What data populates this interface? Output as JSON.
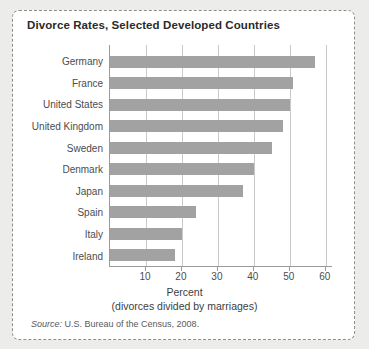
{
  "figure": {
    "title": "Divorce Rates, Selected Developed Countries",
    "source_label": "Source:",
    "source_text": "U.S. Bureau of the Census, 2008.",
    "bar_color": "#a2a2a2",
    "grid_color": "#c9c9c9",
    "axis_color": "#9a9a9a",
    "frame_color": "#8c8c8c",
    "page_background": "#ececeb",
    "card_background": "#ffffff"
  },
  "chart_data": {
    "type": "bar",
    "orientation": "horizontal",
    "title": "Divorce Rates, Selected Developed Countries",
    "subtitle": "",
    "xlabel": "Percent",
    "xlabel_line2": "(divorces divided by marriages)",
    "ylabel": "",
    "categories": [
      "Germany",
      "France",
      "United States",
      "United Kingdom",
      "Sweden",
      "Denmark",
      "Japan",
      "Spain",
      "Italy",
      "Ireland"
    ],
    "values": [
      57,
      51,
      50,
      48,
      45,
      40,
      37,
      24,
      20,
      18
    ],
    "xlim": [
      0,
      62
    ],
    "xticks": [
      10,
      20,
      30,
      40,
      50,
      60
    ],
    "xticklabels": [
      "10",
      "20",
      "30",
      "40",
      "50",
      "60"
    ],
    "grid": "vertical",
    "legend": "none",
    "annotations": []
  }
}
